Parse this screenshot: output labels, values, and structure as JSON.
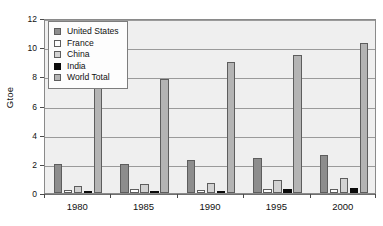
{
  "chart_data": {
    "type": "bar",
    "title": "",
    "xlabel": "",
    "ylabel": "Gtoe",
    "categories": [
      "1980",
      "1985",
      "1990",
      "1995",
      "2000"
    ],
    "ylim": [
      0,
      12
    ],
    "yticks": [
      0,
      2,
      4,
      6,
      8,
      10,
      12
    ],
    "ytick_labels": [
      "0",
      "2",
      "4",
      "6",
      "8",
      "10",
      "12"
    ],
    "grid": true,
    "legend_position": "top-left",
    "series": [
      {
        "name": "United States",
        "color": "#8d8d8d",
        "values": [
          2.0,
          2.0,
          2.25,
          2.4,
          2.6
        ]
      },
      {
        "name": "France",
        "color": "#fdfdfd",
        "values": [
          0.2,
          0.25,
          0.23,
          0.25,
          0.26
        ]
      },
      {
        "name": "China",
        "color": "#d2d2d2",
        "values": [
          0.45,
          0.6,
          0.7,
          0.9,
          1.05
        ]
      },
      {
        "name": "India",
        "color": "#0b0b0b",
        "values": [
          0.08,
          0.12,
          0.16,
          0.27,
          0.31
        ]
      },
      {
        "name": "World Total",
        "color": "#b4b4b4",
        "values": [
          7.2,
          7.85,
          8.95,
          9.45,
          10.3
        ]
      }
    ]
  }
}
